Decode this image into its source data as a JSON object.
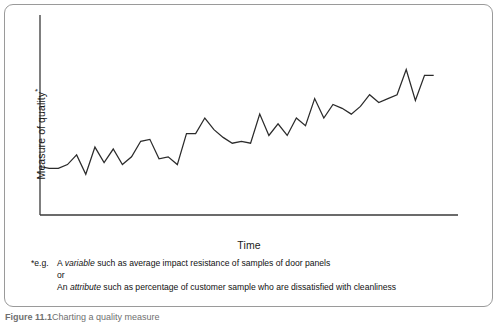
{
  "figure": {
    "y_axis_label": "Measure of quality",
    "y_axis_label_superscript": "*",
    "x_axis_label": "Time",
    "caption_number": "Figure 11.1",
    "caption_title": "Charting a quality measure",
    "border_color": "#9a9a9a",
    "line_color": "#2b2b2b",
    "axis_color": "#3a3a3a",
    "background_color": "#ffffff"
  },
  "footnote": {
    "marker_1": "*e.g.",
    "line_1_pre": "A ",
    "line_1_em": "variable",
    "line_1_post": " such as average impact resistance of samples of door panels",
    "marker_2": "",
    "line_2": "or",
    "marker_3": "",
    "line_3_pre": "An ",
    "line_3_em": "attribute",
    "line_3_post": " such as percentage of customer sample who are dissatisfied with cleanliness"
  },
  "chart_data": {
    "type": "line",
    "title": "",
    "xlabel": "Time",
    "ylabel": "Measure of quality*",
    "grid": false,
    "legend": "none",
    "xlim": [
      0,
      45
    ],
    "ylim": [
      0,
      100
    ],
    "axis_ticks": {
      "x": [],
      "y": []
    },
    "series": [
      {
        "name": "Measure of quality",
        "x": [
          0,
          1,
          2,
          3,
          4,
          5,
          6,
          7,
          8,
          9,
          10,
          11,
          12,
          13,
          14,
          15,
          16,
          17,
          18,
          19,
          20,
          21,
          22,
          23,
          24,
          25,
          26,
          27,
          28,
          29,
          30,
          31,
          32,
          33,
          34,
          35,
          36,
          37,
          38,
          39,
          40,
          41,
          42,
          43
        ],
        "values": [
          25,
          24,
          24,
          26,
          31,
          21,
          35,
          27,
          34,
          26,
          30,
          38,
          39,
          29,
          30,
          26,
          42,
          42,
          50,
          44,
          40,
          37,
          38,
          37,
          52,
          41,
          47,
          41,
          50,
          46,
          60,
          50,
          57,
          55,
          52,
          56,
          62,
          58,
          60,
          62,
          75,
          59,
          72,
          72
        ]
      }
    ]
  }
}
